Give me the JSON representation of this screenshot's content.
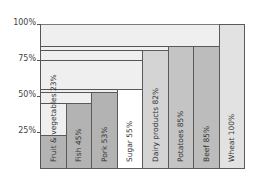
{
  "chart_data": {
    "type": "bar",
    "title": "",
    "xlabel": "",
    "ylabel": "",
    "ylim": [
      0,
      100
    ],
    "yticks": [
      "25%",
      "50%",
      "75%",
      "100%"
    ],
    "grid": false,
    "categories": [
      "Fruit & vegetables",
      "Fish",
      "Pork",
      "Sugar",
      "Dairy products",
      "Potatoes",
      "Beef",
      "Wheat"
    ],
    "values": [
      23,
      45,
      53,
      55,
      82,
      85,
      85,
      100
    ],
    "labels": [
      "Fruit & vegetables 23%",
      "Fish 45%",
      "Pork 53%",
      "Sugar 55%",
      "Dairy products 82%",
      "Potatoes 85%",
      "Beef 85%",
      "Wheat 100%"
    ],
    "colors": [
      "#b3b3b3",
      "#b3b3b3",
      "#b3b3b3",
      "#ffffff",
      "#d4d4d4",
      "#c4c4c4",
      "#bcbcbc",
      "#e2e2e2"
    ],
    "background_fill": "#efefef"
  }
}
